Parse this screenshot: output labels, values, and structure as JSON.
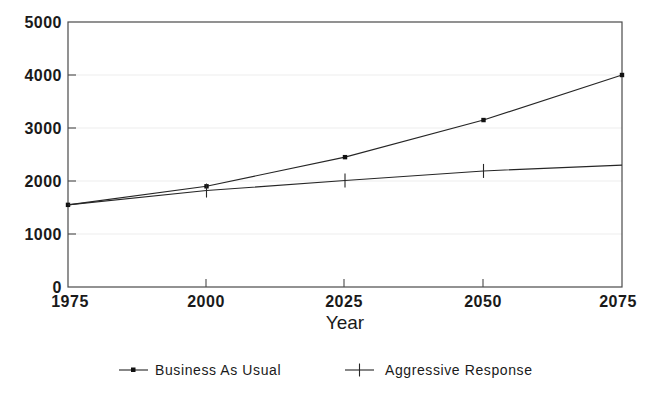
{
  "chart_data": {
    "type": "line",
    "title": "",
    "subtitle": "",
    "xlabel": "Year",
    "ylabel": "",
    "x": [
      1975,
      2000,
      2025,
      2050,
      2075
    ],
    "xtick_labels": [
      "1975",
      "2000",
      "2025",
      "2050",
      "2075"
    ],
    "ytick_labels": [
      "0",
      "1000",
      "2000",
      "3000",
      "4000",
      "5000"
    ],
    "yticks": [
      0,
      1000,
      2000,
      3000,
      4000,
      5000
    ],
    "xlim": [
      1975,
      2075
    ],
    "ylim": [
      0,
      5000
    ],
    "grid": true,
    "grid_axis": "y",
    "legend_position": "bottom",
    "series": [
      {
        "name": "Business As Usual",
        "marker": "dot",
        "values": [
          1550,
          1900,
          2450,
          3150,
          4000
        ]
      },
      {
        "name": "Aggressive Response",
        "marker": "plus",
        "values": [
          1550,
          1820,
          2010,
          2190,
          2300
        ]
      }
    ]
  },
  "legend": {
    "items": [
      {
        "label": "Business As Usual",
        "marker": "dot-marker"
      },
      {
        "label": "Aggressive Response",
        "marker": "plus-marker"
      }
    ]
  },
  "axes": {
    "x_title": "Year"
  }
}
